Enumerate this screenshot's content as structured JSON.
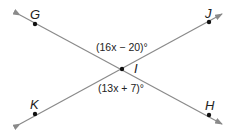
{
  "diagram": {
    "type": "intersecting-lines",
    "intersection": {
      "label": "I",
      "x": 122,
      "y": 69
    },
    "lines": [
      {
        "name": "line-GH",
        "from": {
          "x": 20,
          "y": 15
        },
        "to": {
          "x": 222,
          "y": 124
        }
      },
      {
        "name": "line-KJ",
        "from": {
          "x": 20,
          "y": 124
        },
        "to": {
          "x": 222,
          "y": 14
        }
      }
    ],
    "points": [
      {
        "label": "G",
        "x": 35,
        "y": 24,
        "lx": 30,
        "ly": 19
      },
      {
        "label": "J",
        "x": 209,
        "y": 22,
        "lx": 205,
        "ly": 18
      },
      {
        "label": "K",
        "x": 35,
        "y": 114,
        "lx": 30,
        "ly": 109
      },
      {
        "label": "H",
        "x": 209,
        "y": 115,
        "lx": 205,
        "ly": 110
      },
      {
        "label": "I",
        "x": 122,
        "y": 69,
        "lx": 134,
        "ly": 73
      }
    ],
    "angles": [
      {
        "expression": "(16x − 20)°",
        "x": 96,
        "y": 51
      },
      {
        "expression": "(13x + 7)°",
        "x": 98,
        "y": 92
      }
    ],
    "colors": {
      "line": "#8a8a8a",
      "point": "#111111",
      "text": "#222222"
    }
  }
}
